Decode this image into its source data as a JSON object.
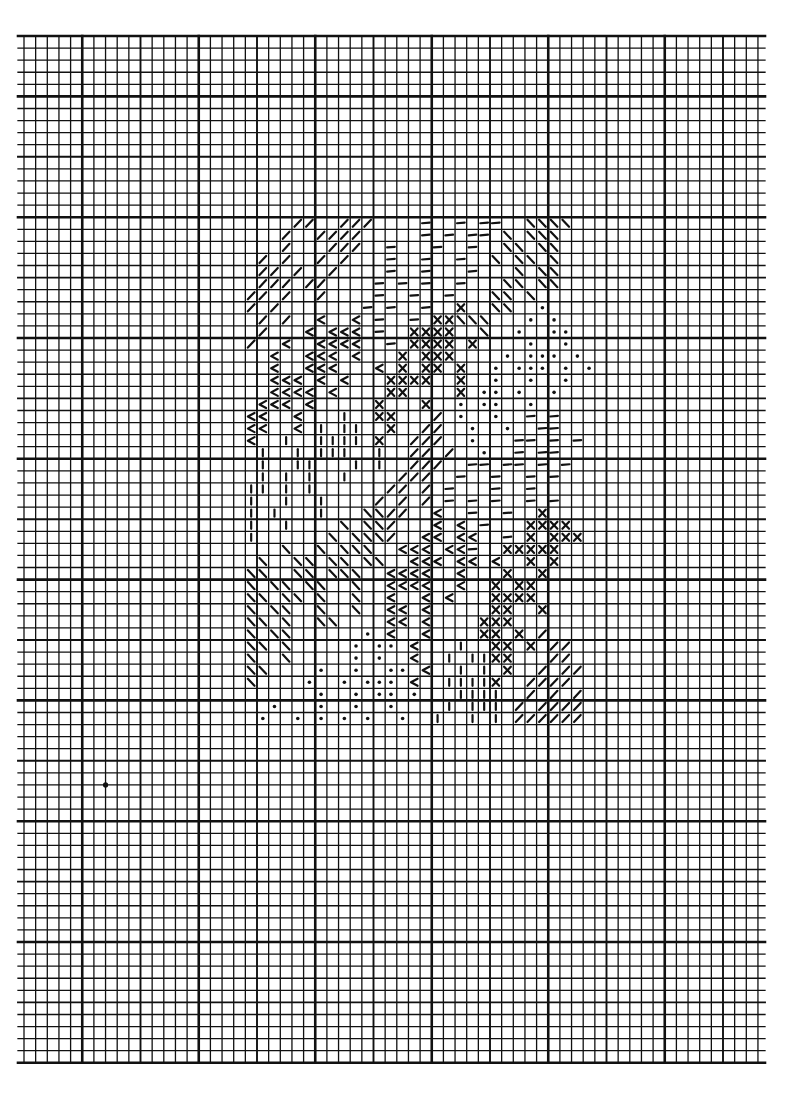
{
  "document": {
    "type": "needlepoint-chart",
    "description": "Stitch chart on graph paper"
  },
  "colors": {
    "paper": "#ffffff",
    "ink": "#111111"
  },
  "chart_data": {
    "type": "heatmap",
    "title": "",
    "grid": {
      "columns": 64,
      "rows": 85,
      "medium_line_every": 5,
      "heavy_line_every": 10
    },
    "legend": {
      "/": "diagonal-forward-stitch",
      "\\": "diagonal-back-stitch",
      "-": "horizontal-dash-stitch",
      "|": "vertical-dash-stitch",
      "<": "chevron-stitch",
      "X": "cross-stitch",
      ".": "dot-stitch"
    },
    "pattern": {
      "first_row": 15,
      "first_col": 19,
      "rows": [
        "    //  ///    -  - --  \\\\\\\\",
        "   /  ////     - - -- \\ \\\\\\",
        "   /   ///  -   -  -  \\\\ \\\\",
        " / /  / /   -  -  -  \\ \\\\ \\",
        " // /  /    -  -   -   \\ \\\\ ",
        " /// //    - - -  -   \\\\ \\\\",
        "// /  /    -  -  -   \\\\ \\  ",
        "/ /       - -  -  X  \\\\  . ",
        " / /  <  < -  - XX\\\\\\   . . ",
        " /   < <<< -  XXXX  \\  .  ..",
        "/  <  <<<<  - XXXX X    .  .",
        "  <  <<< <   X XXX    . ... .",
        "  <  <<<   < X XX X  . ... . .",
        "  <<< < <   XXXX  X  .  .  .",
        "  <<<< <    XX    X .. .  . ",
        " <<< <     X   X  . ..  .   ",
        "<<  <   |  XX   / .  .  - - ",
        "<<  < | ||  X  //  .  .  --  ",
        "<  |  |||| X  ///  .   -- - -",
        " |  | |||  |  // /  .  - --  ",
        " |  ||   | |  ///  -- -- - - ",
        " | | |  |    ///  -  -  - -  ",
        "|| | |      // / -   -  -    ",
        "|  |  |    / / / - - -  - -  ",
        "| |   |   \\\\//  <  -  -  X  ",
        "|  |    \\ \\\\/   < < -   XXXX ",
        "|      \\ \\\\\\/  << <<  - X XXX",
        "   \\  \\ \\\\\\  <<< <<-  XXXXX ",
        " \\  \\\\ \\\\ \\\\  <<< << <  X X ",
        "\\\\  \\\\ \\\\\\  <<<<  <   X  X ",
        "\\ \\\\ \\\\  \\  <<<<  <  X XX  ",
        "\\\\ \\\\ \\  \\  <  < <   XXXX  ",
        "\\ \\\\  \\  \\  << <     XX  X ",
        "\\\\ \\  \\\\    << <    XXX    ",
        "\\ \\\\      . <  <    XX X / ",
        "\\\\ \\     . .. <   |  XX X //",
        "\\  \\     . .  <  | ||XX   //",
        "\\\\    .  .  .. <  | | X  / //",
        "\\    .  . ... <  ||||X  ////",
        "      .  . .. .   ||||  / / /",
        "  .   .  .  .    | ||| / //// ",
        " .  . . . .  .  |  | | //////",
        "                             "
      ]
    },
    "stray_marks": [
      {
        "row": 62,
        "col": 7,
        "symbol": "dot"
      }
    ]
  }
}
